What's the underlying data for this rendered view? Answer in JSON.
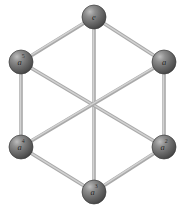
{
  "figure": {
    "name": "cayley-graph-cyclic-group-order-6",
    "background_color": "#ffffff",
    "width": 188,
    "height": 209,
    "node_style": {
      "shape": "sphere",
      "radius": 12,
      "fill_dark": "#4a4a4a",
      "fill_mid": "#6b6b6b",
      "fill_light": "#b9b9b9",
      "stroke": "#3c3c3c"
    },
    "edge_style": {
      "shape": "cylinder",
      "width": 3.6,
      "color": "#a9a9a9",
      "highlight_color": "#d2d2d2"
    },
    "nodes": [
      {
        "id": "e",
        "label_base": "e",
        "label_exponent": "",
        "cx": 94,
        "cy": 17,
        "name": "node-e"
      },
      {
        "id": "a1",
        "label_base": "a",
        "label_exponent": "",
        "cx": 164,
        "cy": 62,
        "name": "node-a"
      },
      {
        "id": "a2",
        "label_base": "a",
        "label_exponent": "2",
        "cx": 164,
        "cy": 147,
        "name": "node-a2"
      },
      {
        "id": "a3",
        "label_base": "a",
        "label_exponent": "3",
        "cx": 94,
        "cy": 192,
        "name": "node-a3"
      },
      {
        "id": "a4",
        "label_base": "a",
        "label_exponent": "4",
        "cx": 21,
        "cy": 147,
        "name": "node-a4"
      },
      {
        "id": "a5",
        "label_base": "a",
        "label_exponent": "5",
        "cx": 21,
        "cy": 62,
        "name": "node-a5"
      }
    ],
    "edges": [
      {
        "from": "e",
        "to": "a1",
        "kind": "hexagon-side",
        "name": "edge-e-a"
      },
      {
        "from": "a1",
        "to": "a2",
        "kind": "hexagon-side",
        "name": "edge-a-a2"
      },
      {
        "from": "a2",
        "to": "a3",
        "kind": "hexagon-side",
        "name": "edge-a2-a3"
      },
      {
        "from": "a3",
        "to": "a4",
        "kind": "hexagon-side",
        "name": "edge-a3-a4"
      },
      {
        "from": "a4",
        "to": "a5",
        "kind": "hexagon-side",
        "name": "edge-a4-a5"
      },
      {
        "from": "a5",
        "to": "e",
        "kind": "hexagon-side",
        "name": "edge-a5-e"
      },
      {
        "from": "e",
        "to": "a3",
        "kind": "diagonal",
        "name": "edge-e-a3-diagonal"
      },
      {
        "from": "a5",
        "to": "a2",
        "kind": "diagonal",
        "name": "edge-a5-a2-diagonal"
      },
      {
        "from": "a1",
        "to": "a4",
        "kind": "diagonal",
        "name": "edge-a-a4-diagonal"
      }
    ]
  }
}
